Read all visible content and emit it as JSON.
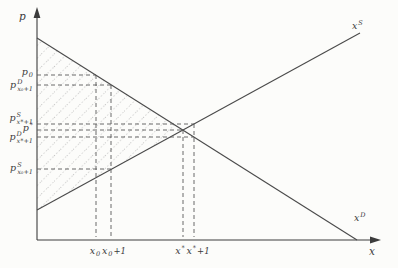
{
  "figure": {
    "type": "supply-demand-diagram",
    "background": "#fcfcfa",
    "axis_color": "#3c3c3c",
    "curve_color": "#4a4a4a",
    "dash_color": "#5a5a5a",
    "hatch_color": "#b4b4b4",
    "curves": [
      {
        "name": "supply",
        "label": "x^S",
        "direction": "upward-sloping"
      },
      {
        "name": "demand",
        "label": "x^D",
        "direction": "downward-sloping"
      }
    ],
    "guide_prices": [
      "p0",
      "p^D_x0+1",
      "p^S_x*+1",
      "p*",
      "p^D_x*+1",
      "p^S_x0+1"
    ],
    "guide_quantities": [
      "x0",
      "x0+1",
      "x*",
      "x*+1"
    ]
  },
  "labels": {
    "p_axis": "p",
    "x_axis": "x",
    "supply": {
      "base": "x",
      "sup": "S"
    },
    "demand": {
      "base": "x",
      "sup": "D"
    },
    "price_p0": {
      "base": "p",
      "sub": "0"
    },
    "price_pd_x0p1": {
      "base": "p",
      "sup": "D",
      "sub": "x₀+1"
    },
    "price_ps_xstar1": {
      "base": "p",
      "sup": "S",
      "sub": "x*+1"
    },
    "price_pstar": {
      "base": "p",
      "sup": "*"
    },
    "price_pd_xstar1": {
      "base": "p",
      "sup": "D",
      "sub": "x*+1"
    },
    "price_ps_x0p1": {
      "base": "p",
      "sup": "S",
      "sub": "x₀+1"
    },
    "tick_x0": {
      "base": "x",
      "sub": "0"
    },
    "tick_x0p1": {
      "base": "x",
      "sub": "0",
      "rest": "+1"
    },
    "tick_xstar": {
      "base": "x",
      "sup": "*"
    },
    "tick_xstarp1": {
      "base": "x",
      "sup": "*",
      "rest": "+1"
    }
  }
}
